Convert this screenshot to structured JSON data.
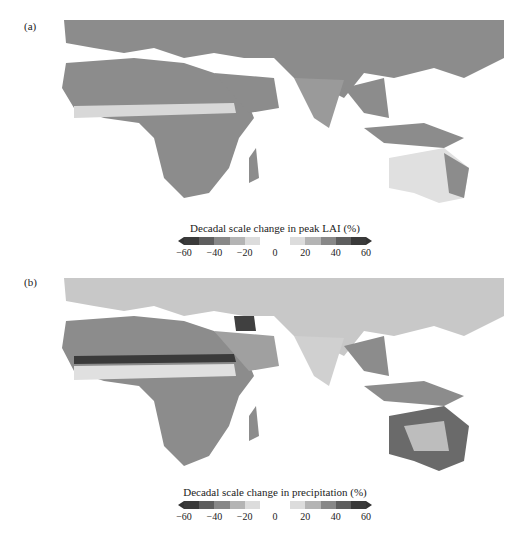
{
  "figure": {
    "panels": [
      {
        "label": "(a)",
        "colorbar": {
          "title": "Decadal scale change in peak LAI (%)",
          "ticks": [
            "−60",
            "−40",
            "−20",
            "0",
            "20",
            "40",
            "60"
          ]
        },
        "region": "Africa, Europe, Middle East, South/Southeast Asia, Australia"
      },
      {
        "label": "(b)",
        "colorbar": {
          "title": "Decadal scale change in precipitation (%)",
          "ticks": [
            "−60",
            "−40",
            "−20",
            "0",
            "20",
            "40",
            "60"
          ]
        },
        "region": "Africa, Europe, Middle East, South/Southeast Asia, Australia"
      }
    ],
    "colorbar_shades": [
      "#3a3a3a",
      "#5e5e5e",
      "#888888",
      "#b4b4b4",
      "#dcdcdc",
      "#ffffff",
      "#ffffff",
      "#dcdcdc",
      "#b4b4b4",
      "#888888",
      "#5e5e5e",
      "#3a3a3a"
    ]
  }
}
